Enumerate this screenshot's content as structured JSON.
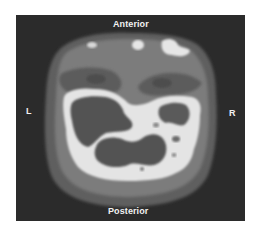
{
  "figure": {
    "type": "axial brain scan (grayscale tomographic slice)",
    "labels": {
      "top": "Anterior",
      "bottom": "Posterior",
      "left": "L",
      "right": "R"
    },
    "colors": {
      "page_background": "#ffffff",
      "panel_background": "#2b2b2b",
      "outer_halo": "#5e5e5e",
      "tissue": "#7b7b7b",
      "low_uptake": "#535353",
      "high_uptake": "#e4e4e4"
    }
  }
}
